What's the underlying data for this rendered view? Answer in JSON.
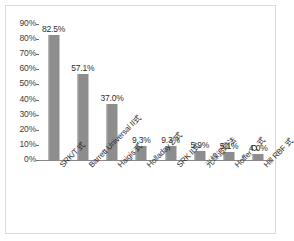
{
  "chart_data": {
    "type": "bar",
    "title": "",
    "subtitle": "",
    "xlabel": "",
    "ylabel": "",
    "ylim": [
      0,
      90
    ],
    "grid": false,
    "legend": "none",
    "y_tick_labels": [
      "90%",
      "80%",
      "70%",
      "60%",
      "50%",
      "40%",
      "30%",
      "20%",
      "10%",
      "0%"
    ],
    "y_ticks": [
      90,
      80,
      70,
      60,
      50,
      40,
      30,
      20,
      10,
      0
    ],
    "categories": [
      "SRK/T 式",
      "Barrett Universal II式",
      "Haigis 式",
      "Holladay 2 式",
      "SRK II式",
      "光線追跡法",
      "Hoffer Q 式",
      "Hill RBF 式"
    ],
    "values": [
      82.5,
      57.1,
      37.0,
      9.3,
      9.3,
      5.9,
      5.1,
      4.0
    ],
    "value_labels": [
      "82.5%",
      "57.1%",
      "37.0%",
      "9.3%",
      "9.3%",
      "5.9%",
      "5.1%",
      "4.0%"
    ],
    "series": [
      {
        "name": "",
        "values": [
          82.5,
          57.1,
          37.0,
          9.3,
          9.3,
          5.9,
          5.1,
          4.0
        ]
      }
    ]
  },
  "style": {
    "bar_color": "#8d8d8d",
    "axis_color": "#6e6e6e",
    "frame_color": "#cfdfe6",
    "text_color": "#2e2e2e",
    "plot_background": "#ffffff"
  }
}
